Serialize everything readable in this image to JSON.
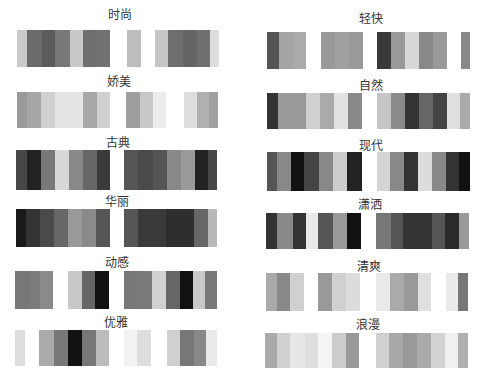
{
  "palettes": [
    {
      "label": "时尚",
      "title_x": 120,
      "title_y": 9,
      "bar_y": 30,
      "bar_h": 37,
      "stripes": [
        [
          17,
          10,
          "#c9c9c9"
        ],
        [
          27,
          15,
          "#6b6b6b"
        ],
        [
          42,
          13,
          "#5c5c5c"
        ],
        [
          55,
          15,
          "#787878"
        ],
        [
          70,
          13,
          "#c8c8c8"
        ],
        [
          83,
          14,
          "#6f6f6f"
        ],
        [
          97,
          13,
          "#727272"
        ],
        [
          127,
          14,
          "#bdbdbd"
        ],
        [
          155,
          13,
          "#c6c6c6"
        ],
        [
          168,
          15,
          "#6e6e6e"
        ],
        [
          183,
          14,
          "#646464"
        ],
        [
          197,
          13,
          "#707070"
        ],
        [
          210,
          9,
          "#dcdcdc"
        ]
      ]
    },
    {
      "label": "娇美",
      "title_x": 119,
      "title_y": 76,
      "bar_y": 92,
      "bar_h": 36,
      "stripes": [
        [
          17,
          10,
          "#9a9a9a"
        ],
        [
          27,
          14,
          "#a6a6a6"
        ],
        [
          41,
          14,
          "#d0d0d0"
        ],
        [
          55,
          28,
          "#e4e4e4"
        ],
        [
          83,
          14,
          "#a8a8a8"
        ],
        [
          97,
          13,
          "#d0d0d0"
        ],
        [
          126,
          14,
          "#9e9e9e"
        ],
        [
          140,
          13,
          "#c8c8c8"
        ],
        [
          153,
          13,
          "#ececec"
        ],
        [
          184,
          13,
          "#dedede"
        ],
        [
          197,
          12,
          "#b0b0b0"
        ],
        [
          209,
          9,
          "#a0a0a0"
        ]
      ]
    },
    {
      "label": "古典",
      "title_x": 118,
      "title_y": 137,
      "bar_y": 150,
      "bar_h": 40,
      "stripes": [
        [
          16,
          11,
          "#474747"
        ],
        [
          27,
          14,
          "#222222"
        ],
        [
          41,
          14,
          "#787878"
        ],
        [
          55,
          14,
          "#d8d8d8"
        ],
        [
          69,
          14,
          "#888888"
        ],
        [
          83,
          14,
          "#666666"
        ],
        [
          97,
          13,
          "#3a3a3a"
        ],
        [
          124,
          14,
          "#555555"
        ],
        [
          138,
          15,
          "#4a4a4a"
        ],
        [
          153,
          14,
          "#555555"
        ],
        [
          167,
          14,
          "#888888"
        ],
        [
          181,
          14,
          "#9a9a9a"
        ],
        [
          195,
          13,
          "#222222"
        ],
        [
          208,
          9,
          "#474747"
        ]
      ]
    },
    {
      "label": "华丽",
      "title_x": 117,
      "title_y": 196,
      "bar_y": 209,
      "bar_h": 38,
      "stripes": [
        [
          16,
          10,
          "#1a1a1a"
        ],
        [
          26,
          14,
          "#333333"
        ],
        [
          40,
          14,
          "#4a4a4a"
        ],
        [
          54,
          14,
          "#666666"
        ],
        [
          68,
          14,
          "#999999"
        ],
        [
          82,
          14,
          "#8a8a8a"
        ],
        [
          96,
          14,
          "#555555"
        ],
        [
          124,
          14,
          "#555555"
        ],
        [
          138,
          28,
          "#3a3a3a"
        ],
        [
          166,
          28,
          "#2e2e2e"
        ],
        [
          194,
          14,
          "#666666"
        ],
        [
          208,
          9,
          "#b8b8b8"
        ]
      ]
    },
    {
      "label": "动感",
      "title_x": 117,
      "title_y": 257,
      "bar_y": 271,
      "bar_h": 38,
      "stripes": [
        [
          15,
          14,
          "#777777"
        ],
        [
          29,
          11,
          "#7b7b7b"
        ],
        [
          40,
          13,
          "#8a8a8a"
        ],
        [
          68,
          14,
          "#c8c8c8"
        ],
        [
          82,
          13,
          "#666666"
        ],
        [
          95,
          14,
          "#111111"
        ],
        [
          124,
          13,
          "#777777"
        ],
        [
          137,
          15,
          "#7a7a7a"
        ],
        [
          152,
          14,
          "#d0d0d0"
        ],
        [
          166,
          14,
          "#666666"
        ],
        [
          180,
          13,
          "#111111"
        ],
        [
          193,
          12,
          "#c8c8c8"
        ],
        [
          205,
          12,
          "#777777"
        ]
      ]
    },
    {
      "label": "优雅",
      "title_x": 116,
      "title_y": 317,
      "bar_y": 330,
      "bar_h": 36,
      "stripes": [
        [
          15,
          10,
          "#dddddd"
        ],
        [
          39,
          15,
          "#aaaaaa"
        ],
        [
          54,
          14,
          "#777777"
        ],
        [
          68,
          14,
          "#111111"
        ],
        [
          82,
          14,
          "#777777"
        ],
        [
          96,
          13,
          "#bbbbbb"
        ],
        [
          124,
          13,
          "#f2f2f2"
        ],
        [
          137,
          14,
          "#dedede"
        ],
        [
          167,
          13,
          "#d0d0d0"
        ],
        [
          180,
          14,
          "#777777"
        ],
        [
          194,
          12,
          "#888888"
        ],
        [
          206,
          11,
          "#eaeaea"
        ]
      ]
    },
    {
      "label": "轻快",
      "title_x": 371,
      "title_y": 13,
      "bar_y": 32,
      "bar_h": 37,
      "stripes": [
        [
          267,
          12,
          "#555555"
        ],
        [
          279,
          14,
          "#a5a5a5"
        ],
        [
          293,
          13,
          "#aaaaaa"
        ],
        [
          321,
          14,
          "#999999"
        ],
        [
          335,
          14,
          "#a0a0a0"
        ],
        [
          349,
          14,
          "#999999"
        ],
        [
          377,
          14,
          "#3a3a3a"
        ],
        [
          391,
          14,
          "#999999"
        ],
        [
          405,
          14,
          "#d8d8d8"
        ],
        [
          419,
          14,
          "#888888"
        ],
        [
          433,
          14,
          "#999999"
        ],
        [
          461,
          9,
          "#888888"
        ]
      ]
    },
    {
      "label": "自然",
      "title_x": 371,
      "title_y": 80,
      "bar_y": 93,
      "bar_h": 36,
      "stripes": [
        [
          267,
          11,
          "#333333"
        ],
        [
          278,
          28,
          "#999999"
        ],
        [
          306,
          14,
          "#d0d0d0"
        ],
        [
          320,
          14,
          "#aaaaaa"
        ],
        [
          334,
          14,
          "#e2e2e2"
        ],
        [
          348,
          14,
          "#888888"
        ],
        [
          377,
          14,
          "#c5c5c5"
        ],
        [
          391,
          14,
          "#8a8a8a"
        ],
        [
          405,
          14,
          "#333333"
        ],
        [
          419,
          14,
          "#666666"
        ],
        [
          433,
          14,
          "#444444"
        ],
        [
          447,
          13,
          "#e0e0e0"
        ],
        [
          460,
          10,
          "#aaaaaa"
        ]
      ]
    },
    {
      "label": "现代",
      "title_x": 371,
      "title_y": 140,
      "bar_y": 152,
      "bar_h": 39,
      "stripes": [
        [
          267,
          10,
          "#555555"
        ],
        [
          277,
          14,
          "#888888"
        ],
        [
          291,
          13,
          "#111111"
        ],
        [
          304,
          15,
          "#444444"
        ],
        [
          319,
          14,
          "#888888"
        ],
        [
          333,
          14,
          "#cccccc"
        ],
        [
          347,
          15,
          "#222222"
        ],
        [
          377,
          13,
          "#d5d5d5"
        ],
        [
          390,
          14,
          "#888888"
        ],
        [
          404,
          14,
          "#333333"
        ],
        [
          418,
          14,
          "#dcdcdc"
        ],
        [
          432,
          14,
          "#888888"
        ],
        [
          446,
          13,
          "#333333"
        ],
        [
          459,
          11,
          "#111111"
        ]
      ]
    },
    {
      "label": "潇洒",
      "title_x": 370,
      "title_y": 199,
      "bar_y": 213,
      "bar_h": 36,
      "stripes": [
        [
          266,
          11,
          "#333333"
        ],
        [
          277,
          16,
          "#888888"
        ],
        [
          293,
          13,
          "#333333"
        ],
        [
          306,
          12,
          "#e8e8e8"
        ],
        [
          318,
          15,
          "#555555"
        ],
        [
          333,
          14,
          "#999999"
        ],
        [
          347,
          14,
          "#111111"
        ],
        [
          376,
          15,
          "#777777"
        ],
        [
          391,
          12,
          "#555555"
        ],
        [
          403,
          29,
          "#333333"
        ],
        [
          432,
          13,
          "#555555"
        ],
        [
          445,
          14,
          "#2a2a2a"
        ],
        [
          459,
          10,
          "#999999"
        ]
      ]
    },
    {
      "label": "清爽",
      "title_x": 369,
      "title_y": 261,
      "bar_y": 273,
      "bar_h": 38,
      "stripes": [
        [
          266,
          11,
          "#aaaaaa"
        ],
        [
          277,
          13,
          "#888888"
        ],
        [
          290,
          14,
          "#d0d0d0"
        ],
        [
          318,
          14,
          "#999999"
        ],
        [
          332,
          14,
          "#d0d0d0"
        ],
        [
          346,
          14,
          "#dcdcdc"
        ],
        [
          376,
          14,
          "#eaeaea"
        ],
        [
          390,
          14,
          "#aaaaaa"
        ],
        [
          404,
          14,
          "#999999"
        ],
        [
          418,
          13,
          "#e0e0e0"
        ],
        [
          446,
          12,
          "#eaeaea"
        ],
        [
          458,
          10,
          "#777777"
        ]
      ]
    },
    {
      "label": "浪漫",
      "title_x": 368,
      "title_y": 319,
      "bar_y": 333,
      "bar_h": 35,
      "stripes": [
        [
          265,
          12,
          "#aaaaaa"
        ],
        [
          277,
          13,
          "#d0d0d0"
        ],
        [
          290,
          15,
          "#e6e6e6"
        ],
        [
          305,
          13,
          "#dedede"
        ],
        [
          318,
          14,
          "#f4f4f4"
        ],
        [
          332,
          14,
          "#cccccc"
        ],
        [
          346,
          13,
          "#999999"
        ],
        [
          376,
          13,
          "#d0d0d0"
        ],
        [
          389,
          14,
          "#a8a8a8"
        ],
        [
          403,
          14,
          "#999999"
        ],
        [
          417,
          14,
          "#aaaaaa"
        ],
        [
          431,
          14,
          "#d2d2d2"
        ],
        [
          445,
          13,
          "#f0f0f0"
        ],
        [
          458,
          10,
          "#b0b0b0"
        ]
      ]
    }
  ]
}
